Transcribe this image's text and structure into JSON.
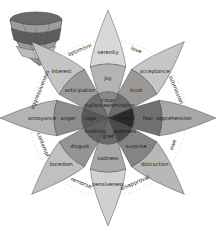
{
  "petals": [
    {
      "outer": "serenity",
      "mid": "joy",
      "inner": "ecstasy",
      "colors": [
        "#d8d8d8",
        "#b4b4b4",
        "#8a8a8a"
      ]
    },
    {
      "outer": "acceptance",
      "mid": "trust",
      "inner": "admiration",
      "colors": [
        "#c6c6c6",
        "#9a9a9a",
        "#6c6c6c"
      ]
    },
    {
      "outer": "apprehension",
      "mid": "fear",
      "inner": "terror",
      "colors": [
        "#a8a8a8",
        "#707070",
        "#2a2a2a"
      ]
    },
    {
      "outer": "distraction",
      "mid": "surprise",
      "inner": "amazement",
      "colors": [
        "#b8b8b8",
        "#848484",
        "#4a4a4a"
      ]
    },
    {
      "outer": "pensiveness",
      "mid": "sadness",
      "inner": "grief",
      "colors": [
        "#d0d0d0",
        "#a8a8a8",
        "#6a6a6a"
      ]
    },
    {
      "outer": "boredom",
      "mid": "disgust",
      "inner": "loathing",
      "colors": [
        "#c0c0c0",
        "#949494",
        "#626262"
      ]
    },
    {
      "outer": "annoyance",
      "mid": "anger",
      "inner": "rage",
      "colors": [
        "#b4b4b4",
        "#8c8c8c",
        "#585858"
      ]
    },
    {
      "outer": "interest",
      "mid": "anticipation",
      "inner": "vigilance",
      "colors": [
        "#c4c4c4",
        "#9c9c9c",
        "#6e6e6e"
      ]
    }
  ],
  "dyads": [
    "love",
    "submission",
    "awe",
    "disapproval",
    "remorse",
    "contempt",
    "aggressiveness",
    "optimism"
  ]
}
